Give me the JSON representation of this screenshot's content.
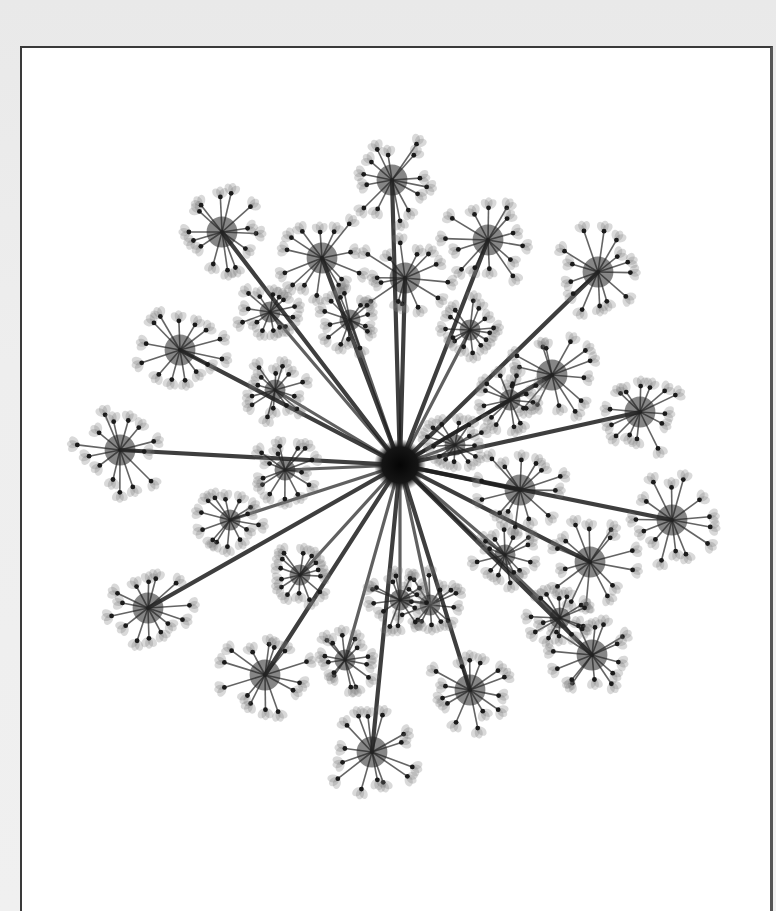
{
  "scene": {
    "subject": "X-ray image of Queen Anne's lace flower head (umbel) in a white frame",
    "background_color": "#ececec",
    "mat_color": "#ffffff",
    "frame_color": "#3a3a3a",
    "ink_color": "#1a1a1a"
  },
  "flower": {
    "center": [
      400,
      465
    ],
    "umbel_count_outer": 18,
    "umbel_count_inner": 14,
    "outer_umbels": [
      [
        392,
        180
      ],
      [
        488,
        240
      ],
      [
        598,
        272
      ],
      [
        552,
        375
      ],
      [
        640,
        412
      ],
      [
        672,
        520
      ],
      [
        590,
        562
      ],
      [
        592,
        655
      ],
      [
        470,
        690
      ],
      [
        372,
        752
      ],
      [
        265,
        675
      ],
      [
        148,
        608
      ],
      [
        120,
        450
      ],
      [
        180,
        350
      ],
      [
        222,
        232
      ],
      [
        322,
        258
      ],
      [
        405,
        278
      ],
      [
        520,
        490
      ]
    ],
    "inner_umbels": [
      [
        350,
        320
      ],
      [
        470,
        330
      ],
      [
        510,
        400
      ],
      [
        275,
        390
      ],
      [
        270,
        312
      ],
      [
        230,
        520
      ],
      [
        300,
        575
      ],
      [
        345,
        660
      ],
      [
        430,
        605
      ],
      [
        505,
        555
      ],
      [
        560,
        618
      ],
      [
        285,
        470
      ],
      [
        455,
        445
      ],
      [
        400,
        600
      ]
    ]
  }
}
